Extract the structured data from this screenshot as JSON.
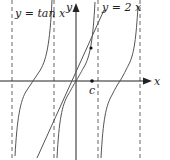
{
  "figure": {
    "labels": {
      "tan_curve": "y = tan x",
      "line": "y = 2 x",
      "y_axis": "y",
      "x_axis": "x",
      "point_c": "c"
    },
    "colors": {
      "curve": "#555555",
      "axis": "#222222",
      "asymptote": "#666666",
      "point": "#111111"
    },
    "asymptotes_x_px": [
      12,
      54,
      98,
      140
    ],
    "origin_px": [
      76,
      81
    ]
  }
}
